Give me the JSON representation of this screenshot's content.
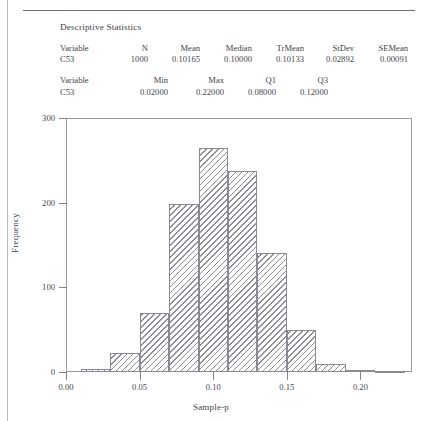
{
  "page": {
    "top_cut_text": "",
    "stats_title": "Descriptive Statistics"
  },
  "stats": {
    "block1": {
      "headers": [
        "Variable",
        "N",
        "Mean",
        "Median",
        "TrMean",
        "StDev",
        "SEMean"
      ],
      "row": [
        "C53",
        "1000",
        "0.10165",
        "0.10000",
        "0.10133",
        "0.02892",
        "0.00091"
      ]
    },
    "block2": {
      "headers": [
        "Variable",
        "Min",
        "Max",
        "Q1",
        "Q3"
      ],
      "row": [
        "C53",
        "0.02000",
        "0.22000",
        "0.08000",
        "0.12000"
      ]
    }
  },
  "chart_data": {
    "type": "bar",
    "title": "",
    "subtitle": "",
    "xlabel": "Sample-p",
    "ylabel": "Frequency",
    "xlim": [
      0.0,
      0.235
    ],
    "ylim": [
      0,
      300
    ],
    "grid": false,
    "legend": null,
    "x_ticks": [
      0.0,
      0.05,
      0.1,
      0.15,
      0.2
    ],
    "x_tick_labels": [
      "0.00",
      "0.05",
      "0.10",
      "0.15",
      "0.20"
    ],
    "y_ticks": [
      0,
      100,
      200,
      300
    ],
    "y_tick_labels": [
      "0",
      "100",
      "200",
      "300"
    ],
    "bin_width": 0.02,
    "bins": [
      {
        "start": 0.01,
        "end": 0.03,
        "value": 3
      },
      {
        "start": 0.03,
        "end": 0.05,
        "value": 22
      },
      {
        "start": 0.05,
        "end": 0.07,
        "value": 70
      },
      {
        "start": 0.07,
        "end": 0.09,
        "value": 198
      },
      {
        "start": 0.09,
        "end": 0.11,
        "value": 265
      },
      {
        "start": 0.11,
        "end": 0.13,
        "value": 237
      },
      {
        "start": 0.13,
        "end": 0.15,
        "value": 140
      },
      {
        "start": 0.15,
        "end": 0.17,
        "value": 50
      },
      {
        "start": 0.17,
        "end": 0.19,
        "value": 10
      },
      {
        "start": 0.19,
        "end": 0.21,
        "value": 2
      },
      {
        "start": 0.21,
        "end": 0.23,
        "value": 1
      }
    ],
    "categories": [
      "0.01-0.03",
      "0.03-0.05",
      "0.05-0.07",
      "0.07-0.09",
      "0.09-0.11",
      "0.11-0.13",
      "0.13-0.15",
      "0.15-0.17",
      "0.17-0.19",
      "0.19-0.21",
      "0.21-0.23"
    ],
    "values": [
      3,
      22,
      70,
      198,
      265,
      237,
      140,
      50,
      10,
      2,
      1
    ]
  }
}
